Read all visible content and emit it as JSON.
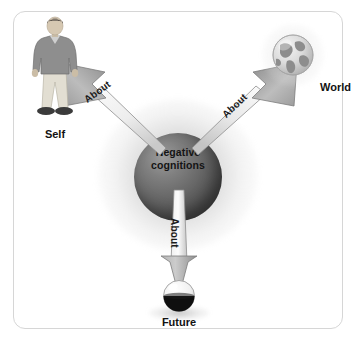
{
  "diagram": {
    "center": {
      "label_line1": "Negative",
      "label_line2": "cognitions",
      "sphere_color": "#4e4e4e",
      "glow_color": "#a5a5a5"
    },
    "arrows": [
      {
        "name": "arrow-about-self",
        "label": "About",
        "direction": "up-left",
        "target": "Self"
      },
      {
        "name": "arrow-about-world",
        "label": "About",
        "direction": "up-right",
        "target": "World"
      },
      {
        "name": "arrow-about-future",
        "label": "About",
        "direction": "down",
        "target": "Future"
      }
    ],
    "nodes": [
      {
        "name": "self-node",
        "label": "Self",
        "icon": "person-standing-icon",
        "position": "top-left"
      },
      {
        "name": "world-node",
        "label": "World",
        "icon": "globe-icon",
        "position": "top-right"
      },
      {
        "name": "future-node",
        "label": "Future",
        "icon": "half-filled-sphere-icon",
        "position": "bottom-center"
      }
    ],
    "frame": {
      "border_color": "#d6d6d6",
      "background": "#ffffff"
    },
    "palette": {
      "text": "#121212",
      "arrow_fill_light": "#f2f2f2",
      "arrow_fill_dark": "#9a9a9a",
      "arrow_stroke": "#6e6e6e"
    }
  }
}
